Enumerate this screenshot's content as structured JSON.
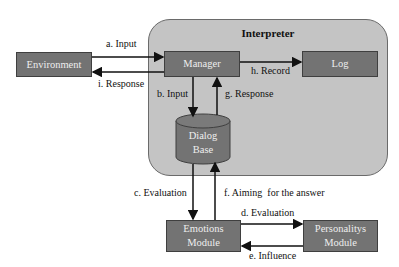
{
  "diagram": {
    "container": {
      "title": "Interpreter",
      "fill": "#c4c4c4"
    },
    "nodes": {
      "environment": "Environment",
      "manager": "Manager",
      "log": "Log",
      "dialog_base_line1": "Dialog",
      "dialog_base_line2": "Base",
      "emotions_line1": "Emotions",
      "emotions_line2": "Module",
      "personality_line1": "Personalitys",
      "personality_line2": "Module"
    },
    "edges": {
      "a": "a. Input",
      "b": "b. Input",
      "c": "c. Evaluation",
      "d": "d. Evaluation",
      "e": "e. Influence",
      "f": "f. Aiming  for the answer",
      "g": "g. Response",
      "h": "h. Record",
      "i": "i. Response"
    },
    "colors": {
      "node_fill": "#737373",
      "node_text": "#eeeeee",
      "arrow": "#111111"
    }
  }
}
